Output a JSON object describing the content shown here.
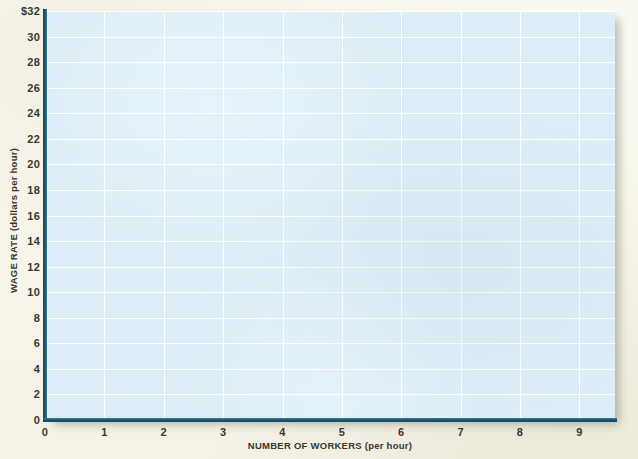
{
  "chart_data": {
    "type": "line",
    "title": "",
    "subtitle": "",
    "note": "Blank graph grid provided for plotting; no data series are drawn.",
    "xlabel": "NUMBER OF WORKERS (per hour)",
    "ylabel": "WAGE RATE (dollars per hour)",
    "xlim": [
      0,
      9.6
    ],
    "ylim": [
      0,
      32
    ],
    "x_ticks": [
      0,
      1,
      2,
      3,
      4,
      5,
      6,
      7,
      8,
      9
    ],
    "x_tick_labels": [
      "0",
      "1",
      "2",
      "3",
      "4",
      "5",
      "6",
      "7",
      "8",
      "9"
    ],
    "y_ticks": [
      0,
      2,
      4,
      6,
      8,
      10,
      12,
      14,
      16,
      18,
      20,
      22,
      24,
      26,
      28,
      30,
      32
    ],
    "y_tick_labels": [
      "0",
      "2",
      "4",
      "6",
      "8",
      "10",
      "12",
      "14",
      "16",
      "18",
      "20",
      "22",
      "24",
      "26",
      "28",
      "30",
      "$32"
    ],
    "grid": true,
    "legend": null,
    "series": [],
    "annotations": []
  },
  "style": {
    "plot_fill": "#dcedf7",
    "gridline_color": "#ffffff",
    "axis_color": "#17485c",
    "paper_background": "#f9f8ef",
    "tick_text_color": "#3a382f"
  }
}
